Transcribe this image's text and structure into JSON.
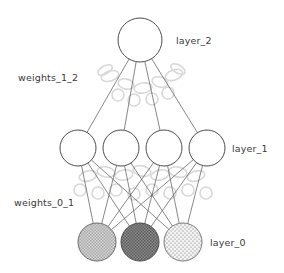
{
  "diagram": {
    "background_color": "#ffffff",
    "width": 284,
    "height": 273,
    "stroke_color": "#4d4d4d",
    "edge_color": "#555555",
    "watermark_color": "#d8d8d8"
  },
  "labels": {
    "layer_2": "layer_2",
    "layer_1": "layer_1",
    "layer_0": "layer_0",
    "weights_1_2": "weights_1_2",
    "weights_0_1": "weights_0_1"
  },
  "layers": [
    {
      "id": "layer_0",
      "label": "layer_0",
      "role": "input",
      "node_count": 3,
      "node_radius": 19,
      "center_y": 242,
      "nodes": [
        {
          "id": "layer0-node-0",
          "cx": 97,
          "cy": 242,
          "fill": "#bdbdbd",
          "pattern": "checker-light",
          "stroke": "#6b6b6b"
        },
        {
          "id": "layer0-node-1",
          "cx": 140,
          "cy": 242,
          "fill": "#777777",
          "pattern": "checker-dark",
          "stroke": "#4a4a4a"
        },
        {
          "id": "layer0-node-2",
          "cx": 183,
          "cy": 242,
          "fill": "#ececec",
          "pattern": "dots-light",
          "stroke": "#7a7a7a"
        }
      ]
    },
    {
      "id": "layer_1",
      "label": "layer_1",
      "role": "hidden",
      "node_count": 4,
      "node_radius": 18,
      "center_y": 148,
      "nodes": [
        {
          "id": "layer1-node-0",
          "cx": 78,
          "cy": 148,
          "fill": "#ffffff",
          "pattern": "none",
          "stroke": "#4d4d4d"
        },
        {
          "id": "layer1-node-1",
          "cx": 121,
          "cy": 148,
          "fill": "#ffffff",
          "pattern": "none",
          "stroke": "#4d4d4d"
        },
        {
          "id": "layer1-node-2",
          "cx": 164,
          "cy": 148,
          "fill": "#ffffff",
          "pattern": "none",
          "stroke": "#4d4d4d"
        },
        {
          "id": "layer1-node-3",
          "cx": 207,
          "cy": 148,
          "fill": "#ffffff",
          "pattern": "none",
          "stroke": "#4d4d4d"
        }
      ]
    },
    {
      "id": "layer_2",
      "label": "layer_2",
      "role": "output",
      "node_count": 1,
      "node_radius": 22,
      "center_y": 40,
      "nodes": [
        {
          "id": "layer2-node-0",
          "cx": 140,
          "cy": 40,
          "fill": "#ffffff",
          "pattern": "none",
          "stroke": "#4d4d4d"
        }
      ]
    }
  ],
  "edge_groups": [
    {
      "id": "weights_0_1",
      "label": "weights_0_1",
      "from_layer": "layer_0",
      "to_layer": "layer_1",
      "edge_count": 12
    },
    {
      "id": "weights_1_2",
      "label": "weights_1_2",
      "from_layer": "layer_1",
      "to_layer": "layer_2",
      "edge_count": 4
    }
  ],
  "watermarks": [
    {
      "cx": 110,
      "cy": 76,
      "rx": 9,
      "ry": 5,
      "rot": -18
    },
    {
      "cx": 126,
      "cy": 84,
      "rx": 8,
      "ry": 5,
      "rot": 12
    },
    {
      "cx": 143,
      "cy": 88,
      "rx": 9,
      "ry": 5,
      "rot": -8
    },
    {
      "cx": 160,
      "cy": 82,
      "rx": 8,
      "ry": 5,
      "rot": 16
    },
    {
      "cx": 174,
      "cy": 75,
      "rx": 9,
      "ry": 5,
      "rot": -20
    },
    {
      "cx": 118,
      "cy": 95,
      "rx": 6,
      "ry": 6,
      "rot": 0
    },
    {
      "cx": 134,
      "cy": 100,
      "rx": 6,
      "ry": 6,
      "rot": 0
    },
    {
      "cx": 152,
      "cy": 99,
      "rx": 6,
      "ry": 6,
      "rot": 0
    },
    {
      "cx": 168,
      "cy": 93,
      "rx": 6,
      "ry": 6,
      "rot": 0
    },
    {
      "cx": 105,
      "cy": 70,
      "rx": 8,
      "ry": 4,
      "rot": -30
    },
    {
      "cx": 178,
      "cy": 69,
      "rx": 8,
      "ry": 4,
      "rot": 30
    },
    {
      "cx": 88,
      "cy": 176,
      "rx": 9,
      "ry": 5,
      "rot": -14
    },
    {
      "cx": 106,
      "cy": 172,
      "rx": 9,
      "ry": 5,
      "rot": 10
    },
    {
      "cx": 124,
      "cy": 175,
      "rx": 9,
      "ry": 5,
      "rot": -10
    },
    {
      "cx": 142,
      "cy": 171,
      "rx": 9,
      "ry": 5,
      "rot": 14
    },
    {
      "cx": 160,
      "cy": 175,
      "rx": 9,
      "ry": 5,
      "rot": -12
    },
    {
      "cx": 178,
      "cy": 172,
      "rx": 9,
      "ry": 5,
      "rot": 12
    },
    {
      "cx": 196,
      "cy": 176,
      "rx": 9,
      "ry": 5,
      "rot": -16
    },
    {
      "cx": 80,
      "cy": 190,
      "rx": 6,
      "ry": 6,
      "rot": 0
    },
    {
      "cx": 98,
      "cy": 193,
      "rx": 6,
      "ry": 6,
      "rot": 0
    },
    {
      "cx": 116,
      "cy": 190,
      "rx": 6,
      "ry": 6,
      "rot": 0
    },
    {
      "cx": 134,
      "cy": 194,
      "rx": 6,
      "ry": 6,
      "rot": 0
    },
    {
      "cx": 152,
      "cy": 190,
      "rx": 6,
      "ry": 6,
      "rot": 0
    },
    {
      "cx": 170,
      "cy": 193,
      "rx": 6,
      "ry": 6,
      "rot": 0
    },
    {
      "cx": 188,
      "cy": 190,
      "rx": 6,
      "ry": 6,
      "rot": 0
    },
    {
      "cx": 206,
      "cy": 193,
      "rx": 6,
      "ry": 6,
      "rot": 0
    }
  ]
}
